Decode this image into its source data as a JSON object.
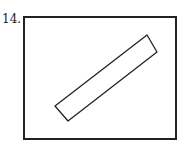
{
  "figure": {
    "label": "14.",
    "stroke_color": "#222222",
    "outer_box": {
      "x": 24,
      "y": 17,
      "width": 152,
      "height": 122
    },
    "inner_shape": {
      "type": "rotated-rectangle",
      "points": "55,106 147,35 157,52 68,121"
    }
  }
}
